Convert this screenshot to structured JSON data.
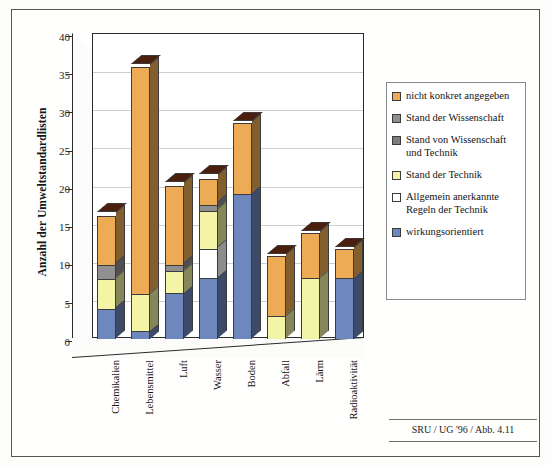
{
  "chart_data": {
    "type": "bar",
    "subtype": "stacked-3d-column",
    "title": "",
    "xlabel": "",
    "ylabel": "Anzahl der Umweltstandardlisten",
    "ylim": [
      0,
      40
    ],
    "ytick_step": 5,
    "yticks": [
      0,
      5,
      10,
      15,
      20,
      25,
      30,
      35,
      40
    ],
    "grid": "horizontal",
    "legend_position": "right",
    "categories": [
      "Chemikalien",
      "Lebensmittel",
      "Luft",
      "Wasser",
      "Boden",
      "Abfall",
      "Lärm",
      "Radioaktivität"
    ],
    "series": [
      {
        "name": "wirkungsorientiert",
        "color": "#6e88bd",
        "values": [
          4,
          1,
          6,
          8,
          19,
          0,
          0,
          8
        ]
      },
      {
        "name": "Allgemein anerkannte Regeln der Technik",
        "color": "#ffffff",
        "values": [
          0,
          0,
          0,
          4,
          0,
          0,
          0,
          0
        ]
      },
      {
        "name": "Stand der Technik",
        "color": "#f4f4a6",
        "values": [
          4,
          5,
          3,
          5,
          0,
          3,
          8,
          0
        ]
      },
      {
        "name": "Stand von Wissenschaft und Technik",
        "color": "#8f8f8f",
        "values": [
          2,
          0,
          1,
          1,
          0,
          0,
          0,
          0
        ]
      },
      {
        "name": "Stand der Wissenschaft",
        "color": "#8f8f8f",
        "values": [
          0,
          0,
          0,
          0,
          0,
          0,
          0,
          0
        ]
      },
      {
        "name": "nicht konkret angegeben",
        "color": "#eeab55",
        "values": [
          6.5,
          30,
          10.5,
          3.5,
          9.5,
          8,
          6,
          4
        ]
      }
    ],
    "totals": [
      16.5,
      36,
      20.5,
      21.5,
      28.5,
      11,
      14,
      12
    ]
  },
  "legend": {
    "items": [
      {
        "label": "nicht konkret angegeben",
        "color": "#eeab55",
        "name": "legend-nicht-konkret-angegeben"
      },
      {
        "label": "Stand der Wissenschaft",
        "color": "#8f8f8f",
        "name": "legend-stand-der-wissenschaft"
      },
      {
        "label": "Stand von Wissenschaft und Technik",
        "color": "#7d7d7d",
        "name": "legend-stand-von-wissenschaft-und-technik"
      },
      {
        "label": "Stand der Technik",
        "color": "#f4f4a6",
        "name": "legend-stand-der-technik"
      },
      {
        "label": "Allgemein anerkannte Regeln der Technik",
        "color": "#ffffff",
        "name": "legend-allgemein-anerkannte-regeln"
      },
      {
        "label": "wirkungsorientiert",
        "color": "#6e88bd",
        "name": "legend-wirkungsorientiert"
      }
    ]
  },
  "caption": {
    "text": "SRU / UG '96 / Abb. 4.11"
  },
  "colors": {
    "orange": "#eeab55",
    "gray": "#8f8f8f",
    "gray_dark": "#7d7d7d",
    "yellow": "#f4f4a6",
    "white": "#ffffff",
    "blue": "#6e88bd",
    "bar_top_shadow": "#4a1f0d",
    "gridline": "#cfcfcf",
    "axis": "#2b2b2b"
  }
}
